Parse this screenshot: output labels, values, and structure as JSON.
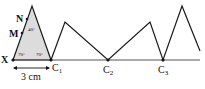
{
  "diagram": {
    "points": {
      "X": "X",
      "M": "M",
      "N": "N",
      "C1": {
        "main": "C",
        "sub": "1"
      },
      "C2": {
        "main": "C",
        "sub": "2"
      },
      "C3": {
        "main": "C",
        "sub": "3"
      }
    },
    "angles": {
      "apex": "40°",
      "base_left": "70°",
      "base_right": "70°"
    },
    "measurement": "3 cm",
    "colors": {
      "line": "#1a1a1a",
      "triangle_fill": "#d9d9d9"
    }
  }
}
